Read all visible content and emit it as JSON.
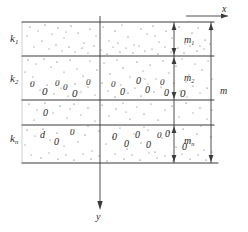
{
  "figure": {
    "axes": {
      "x_label": "x",
      "y_label": "y",
      "x_axis_name": "horizontal-axis",
      "y_axis_name": "vertical-axis-downward"
    },
    "layer_labels": [
      {
        "id": "k1",
        "text": "k",
        "sub": "1"
      },
      {
        "id": "k2",
        "text": "k",
        "sub": "2"
      },
      {
        "id": "kn",
        "text": "k",
        "sub": "n"
      }
    ],
    "thickness_labels": [
      {
        "id": "m1",
        "text": "m",
        "sub": "1"
      },
      {
        "id": "m2",
        "text": "m",
        "sub": "2"
      },
      {
        "id": "mn",
        "text": "m",
        "sub": "n"
      }
    ],
    "total_thickness_label": {
      "id": "m",
      "text": "m",
      "sub": ""
    },
    "grain_glyphs": [
      "0",
      "0",
      "0",
      "0",
      "0",
      "0",
      "0",
      "0",
      "0",
      "0",
      "0",
      "0",
      "0",
      "0",
      "0",
      "0",
      "0",
      "0",
      "d",
      "0",
      "0",
      "0",
      "0",
      "0",
      "0",
      "0",
      "0",
      "0",
      "0",
      "d",
      "0",
      "0"
    ],
    "colors": {
      "line": "#3a3a3a",
      "stipple": "#4a4a4a",
      "text": "#2b2b2b",
      "background": "#ffffff"
    },
    "geometry": {
      "boundaries_y": [
        22,
        56,
        100,
        125,
        163
      ],
      "left_x": 22,
      "right_x": 214,
      "y_axis_x": 100,
      "inner_dim_x": 174,
      "outer_dim_x": 211
    }
  }
}
